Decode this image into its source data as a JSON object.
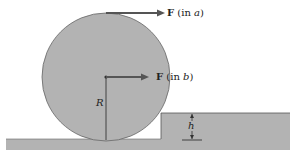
{
  "figure": {
    "type": "physics-diagram",
    "colors": {
      "fill": "#b3b3b3",
      "stroke": "#555555",
      "arrow": "#555555",
      "background": "#ffffff"
    }
  },
  "labels": {
    "force_a_symbol": "F",
    "force_a_note": "(in ",
    "force_a_case": "a",
    "force_b_symbol": "F",
    "force_b_note": "(in ",
    "force_b_case": "b",
    "close": ")",
    "radius": "R",
    "height": "h"
  }
}
